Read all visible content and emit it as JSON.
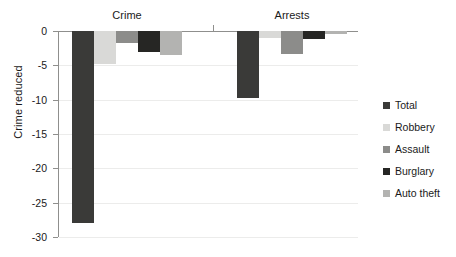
{
  "chart_data": {
    "type": "bar",
    "title": "",
    "xlabel": "",
    "ylabel": "Crime reduced",
    "ylim": [
      -30,
      0
    ],
    "grid": true,
    "orientation": "vertical",
    "legend_position": "right",
    "categories": [
      "Crime",
      "Arrests"
    ],
    "series": [
      {
        "name": "Total",
        "color": "#3a3a38",
        "values": [
          -28.0,
          -9.8
        ]
      },
      {
        "name": "Robbery",
        "color": "#d9d9d7",
        "values": [
          -4.8,
          -1.0
        ]
      },
      {
        "name": "Assault",
        "color": "#8c8c8a",
        "values": [
          -1.8,
          -3.3
        ]
      },
      {
        "name": "Burglary",
        "color": "#262624",
        "values": [
          -3.0,
          -1.2
        ]
      },
      {
        "name": "Auto theft",
        "color": "#b3b3b1",
        "values": [
          -3.5,
          -0.5
        ]
      }
    ],
    "ytick_labels": [
      "0",
      "-5",
      "-10",
      "-15",
      "-20",
      "-25",
      "-30"
    ],
    "ytick_values": [
      0,
      -5,
      -10,
      -15,
      -20,
      -25,
      -30
    ]
  },
  "axis": {
    "y_title": "Crime reduced"
  },
  "groups": [
    {
      "label": "Crime"
    },
    {
      "label": "Arrests"
    }
  ],
  "legend": {
    "items": [
      {
        "label": "Total"
      },
      {
        "label": "Robbery"
      },
      {
        "label": "Assault"
      },
      {
        "label": "Burglary"
      },
      {
        "label": "Auto theft"
      }
    ]
  }
}
